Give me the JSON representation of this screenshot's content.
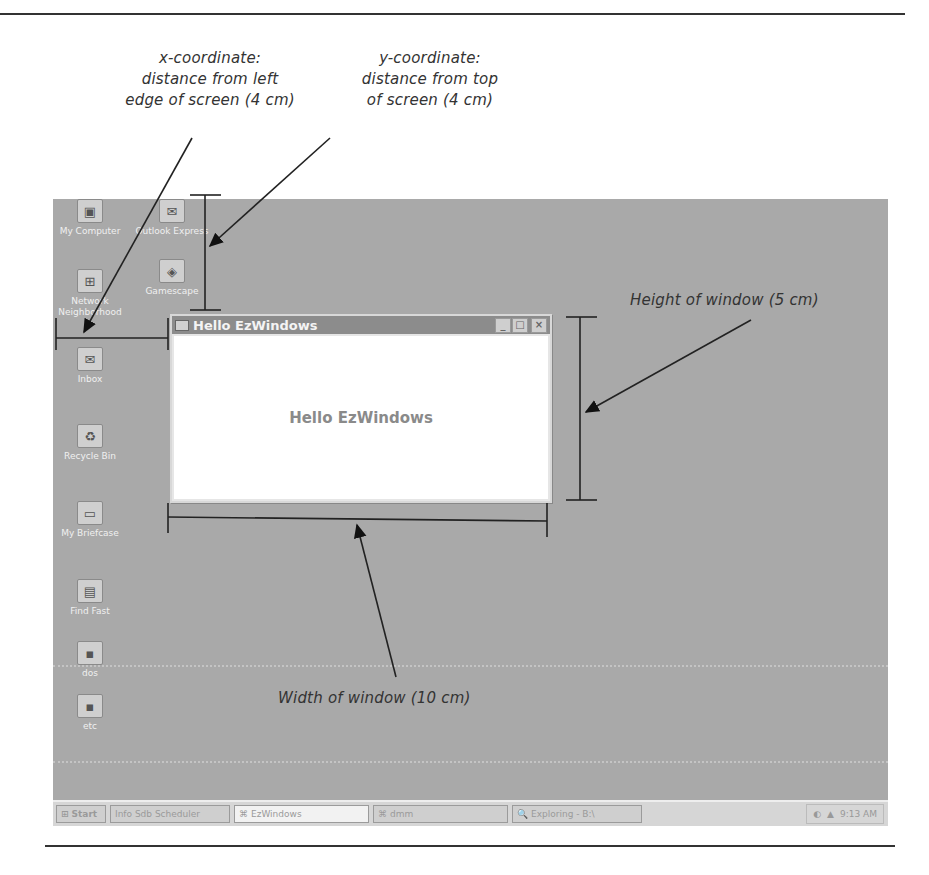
{
  "annotations": {
    "x_coordinate": [
      "x-coordinate:",
      "distance from left",
      "edge of screen (4 cm)"
    ],
    "y_coordinate": [
      "y-coordinate:",
      "distance from top",
      "of screen (4 cm)"
    ],
    "height": "Height of window (5 cm)",
    "width": "Width of window (10 cm)"
  },
  "desktop": {
    "icons": [
      {
        "label": "My Computer",
        "glyph": "▣"
      },
      {
        "label": "Network Neighborhood",
        "glyph": "⊞"
      },
      {
        "label": "Inbox",
        "glyph": "✉"
      },
      {
        "label": "Recycle Bin",
        "glyph": "♻"
      },
      {
        "label": "My Briefcase",
        "glyph": "▭"
      },
      {
        "label": "Find Fast",
        "glyph": "▤"
      },
      {
        "label": "dos",
        "glyph": "▪"
      },
      {
        "label": "etc",
        "glyph": "▪"
      }
    ],
    "icons_col2": [
      {
        "label": "Outlook Express",
        "glyph": "✉"
      },
      {
        "label": "Gamescape",
        "glyph": "◈"
      }
    ]
  },
  "window": {
    "title": "Hello EzWindows",
    "body_text": "Hello EzWindows",
    "buttons": {
      "minimize": "_",
      "maximize": "□",
      "close": "×"
    }
  },
  "taskbar": {
    "start": "Start",
    "buttons": [
      {
        "label": "Info Sdb Scheduler",
        "active": false
      },
      {
        "label": "EzWindows",
        "active": true
      },
      {
        "label": "dmm",
        "active": false
      },
      {
        "label": "Exploring - B:\\",
        "active": false
      }
    ],
    "clock": "9:13 AM"
  }
}
